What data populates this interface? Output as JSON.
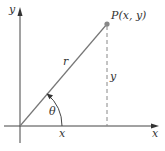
{
  "diagram": {
    "type": "polar-coordinates-figure",
    "axes": {
      "x_label": "x",
      "y_label": "y"
    },
    "point": {
      "label": "P(x, y)"
    },
    "segments": {
      "radius_label": "r",
      "vertical_label": "y",
      "horizontal_label": "x"
    },
    "angle": {
      "label": "θ"
    },
    "colors": {
      "axis": "#444444",
      "radius_line": "#777777",
      "dashed_line": "#888888",
      "point": "#888888",
      "text": "#333333"
    }
  }
}
